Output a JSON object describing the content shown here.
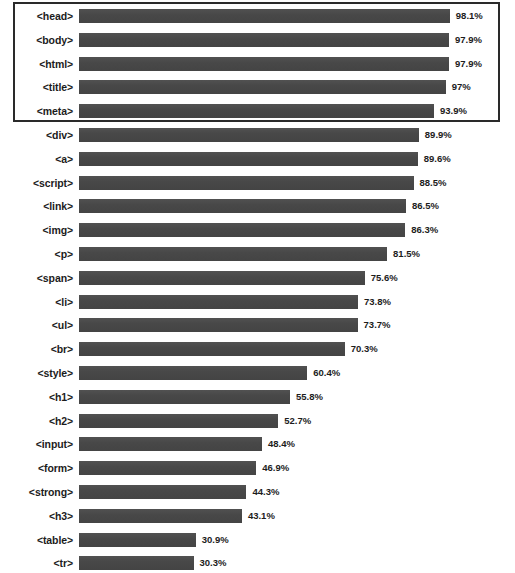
{
  "chart_data": {
    "type": "bar",
    "orientation": "horizontal",
    "title": "",
    "subtitle": "",
    "xlabel": "",
    "ylabel": "",
    "grid": false,
    "legend": false,
    "axis_visible": false,
    "xlim": [
      0,
      100
    ],
    "value_unit": "%",
    "categories": [
      "<head>",
      "<body>",
      "<html>",
      "<title>",
      "<meta>",
      "<div>",
      "<a>",
      "<script>",
      "<link>",
      "<img>",
      "<p>",
      "<span>",
      "<li>",
      "<ul>",
      "<br>",
      "<style>",
      "<h1>",
      "<h2>",
      "<input>",
      "<form>",
      "<strong>",
      "<h3>",
      "<table>",
      "<tr>",
      "<td>"
    ],
    "values": [
      98.1,
      97.9,
      97.9,
      97,
      93.9,
      89.9,
      89.6,
      88.5,
      86.5,
      86.3,
      81.5,
      75.6,
      73.8,
      73.7,
      70.3,
      60.4,
      55.8,
      52.7,
      48.4,
      46.9,
      44.3,
      43.1,
      30.9,
      30.3,
      30.2
    ],
    "value_labels": [
      "98.1%",
      "97.9%",
      "97.9%",
      "97%",
      "93.9%",
      "89.9%",
      "89.6%",
      "88.5%",
      "86.5%",
      "86.3%",
      "81.5%",
      "75.6%",
      "73.8%",
      "73.7%",
      "70.3%",
      "60.4%",
      "55.8%",
      "52.7%",
      "48.4%",
      "46.9%",
      "44.3%",
      "43.1%",
      "30.9%",
      "30.3%",
      "30.2%"
    ],
    "colors": {
      "bar": "#4a4a4a",
      "text": "#1c1c1c",
      "background": "#ffffff",
      "highlight_border": "#2a2a2a"
    },
    "annotations": [
      {
        "type": "highlight-rectangle",
        "covers_categories": [
          "<head>",
          "<body>",
          "<html>",
          "<title>",
          "<meta>"
        ],
        "border_color": "#2a2a2a"
      }
    ]
  },
  "rows": [
    {
      "label": "<head>",
      "value": 98.1,
      "value_label": "98.1%"
    },
    {
      "label": "<body>",
      "value": 97.9,
      "value_label": "97.9%"
    },
    {
      "label": "<html>",
      "value": 97.9,
      "value_label": "97.9%"
    },
    {
      "label": "<title>",
      "value": 97,
      "value_label": "97%"
    },
    {
      "label": "<meta>",
      "value": 93.9,
      "value_label": "93.9%"
    },
    {
      "label": "<div>",
      "value": 89.9,
      "value_label": "89.9%"
    },
    {
      "label": "<a>",
      "value": 89.6,
      "value_label": "89.6%"
    },
    {
      "label": "<script>",
      "value": 88.5,
      "value_label": "88.5%"
    },
    {
      "label": "<link>",
      "value": 86.5,
      "value_label": "86.5%"
    },
    {
      "label": "<img>",
      "value": 86.3,
      "value_label": "86.3%"
    },
    {
      "label": "<p>",
      "value": 81.5,
      "value_label": "81.5%"
    },
    {
      "label": "<span>",
      "value": 75.6,
      "value_label": "75.6%"
    },
    {
      "label": "<li>",
      "value": 73.8,
      "value_label": "73.8%"
    },
    {
      "label": "<ul>",
      "value": 73.7,
      "value_label": "73.7%"
    },
    {
      "label": "<br>",
      "value": 70.3,
      "value_label": "70.3%"
    },
    {
      "label": "<style>",
      "value": 60.4,
      "value_label": "60.4%"
    },
    {
      "label": "<h1>",
      "value": 55.8,
      "value_label": "55.8%"
    },
    {
      "label": "<h2>",
      "value": 52.7,
      "value_label": "52.7%"
    },
    {
      "label": "<input>",
      "value": 48.4,
      "value_label": "48.4%"
    },
    {
      "label": "<form>",
      "value": 46.9,
      "value_label": "46.9%"
    },
    {
      "label": "<strong>",
      "value": 44.3,
      "value_label": "44.3%"
    },
    {
      "label": "<h3>",
      "value": 43.1,
      "value_label": "43.1%"
    },
    {
      "label": "<table>",
      "value": 30.9,
      "value_label": "30.9%"
    },
    {
      "label": "<tr>",
      "value": 30.3,
      "value_label": "30.3%"
    },
    {
      "label": "<td>",
      "value": 30.2,
      "value_label": "30.2%"
    }
  ],
  "layout": {
    "row_pitch": 23.8,
    "first_row_top": 4,
    "bar_origin_x": 79,
    "px_per_percent": 3.78
  }
}
